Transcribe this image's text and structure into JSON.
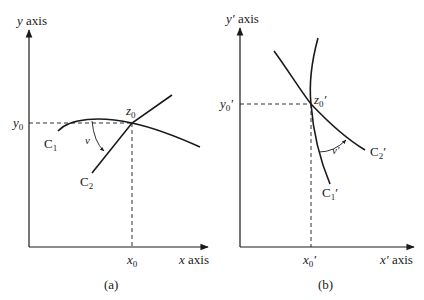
{
  "panel_a": {
    "caption": "(a)",
    "y_axis_label": {
      "var": "y",
      "text": " axis"
    },
    "x_axis_label": {
      "var": "x",
      "text": " axis"
    },
    "point_label": {
      "var": "z",
      "sub": "0"
    },
    "y0_label": {
      "var": "y",
      "sub": "0"
    },
    "x0_label": {
      "var": "x",
      "sub": "0"
    },
    "curve1_label": {
      "var": "C",
      "sub": "1"
    },
    "curve2_label": {
      "var": "C",
      "sub": "2"
    },
    "angle_label": "ν"
  },
  "panel_b": {
    "caption": "(b)",
    "y_axis_label": {
      "var": "y′",
      "text": " axis"
    },
    "x_axis_label": {
      "var": "x′",
      "text": " axis"
    },
    "point_label": {
      "var": "z",
      "sub": "0",
      "prime": "′"
    },
    "y0_label": {
      "var": "y",
      "sub": "0",
      "prime": "′"
    },
    "x0_label": {
      "var": "x",
      "sub": "0",
      "prime": "′"
    },
    "curve1_label": {
      "var": "C",
      "sub": "1",
      "prime": "′"
    },
    "curve2_label": {
      "var": "C",
      "sub": "2",
      "prime": "′"
    },
    "angle_label": "ν′"
  },
  "colors": {
    "stroke": "#1a1a1a",
    "background": "#ffffff"
  }
}
